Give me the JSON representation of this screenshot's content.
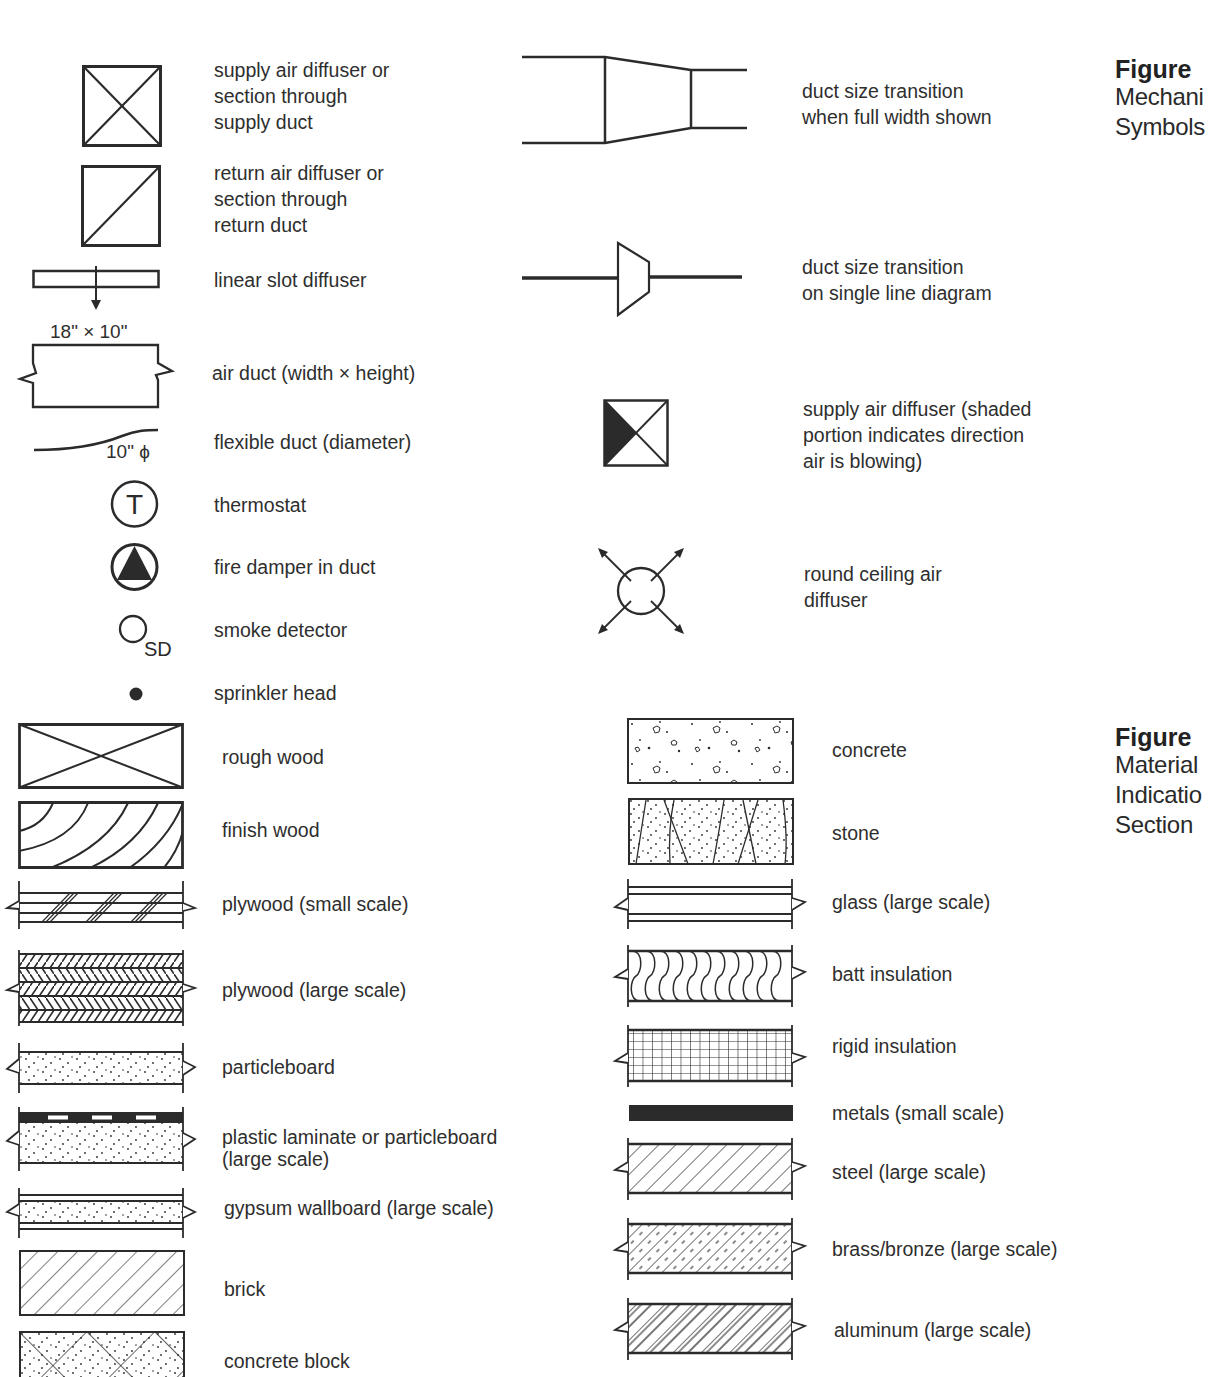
{
  "figures": [
    {
      "number": "Figure",
      "title": "Mechani\nSymbols",
      "symbols": [
        {
          "icon": "supply-air-diffuser-icon",
          "label": "supply air diffuser or\nsection through\nsupply duct"
        },
        {
          "icon": "return-air-diffuser-icon",
          "label": "return air diffuser or\nsection through\nreturn duct"
        },
        {
          "icon": "linear-slot-diffuser-icon",
          "label": "linear slot diffuser"
        },
        {
          "icon": "air-duct-icon",
          "label": "air duct (width × height)",
          "annotation": "18\" × 10\""
        },
        {
          "icon": "flexible-duct-icon",
          "label": "flexible duct (diameter)",
          "annotation": "10\" ϕ"
        },
        {
          "icon": "thermostat-icon",
          "label": "thermostat",
          "glyph": "T"
        },
        {
          "icon": "fire-damper-icon",
          "label": "fire damper in duct"
        },
        {
          "icon": "smoke-detector-icon",
          "label": "smoke detector",
          "glyph": "SD"
        },
        {
          "icon": "sprinkler-head-icon",
          "label": "sprinkler head"
        },
        {
          "icon": "duct-transition-full-width-icon",
          "label": "duct size transition\nwhen full width shown"
        },
        {
          "icon": "duct-transition-single-line-icon",
          "label": "duct size transition\non single line diagram"
        },
        {
          "icon": "directional-supply-diffuser-icon",
          "label": "supply air diffuser (shaded\nportion indicates direction\nair is blowing)"
        },
        {
          "icon": "round-ceiling-diffuser-icon",
          "label": "round ceiling air\ndiffuser"
        }
      ]
    },
    {
      "number": "Figure",
      "title": "Material\nIndicatio\nSection",
      "materials": [
        {
          "icon": "rough-wood-icon",
          "label": "rough wood"
        },
        {
          "icon": "finish-wood-icon",
          "label": "finish wood"
        },
        {
          "icon": "plywood-small-scale-icon",
          "label": "plywood (small scale)"
        },
        {
          "icon": "plywood-large-scale-icon",
          "label": "plywood (large scale)"
        },
        {
          "icon": "particleboard-icon",
          "label": "particleboard"
        },
        {
          "icon": "plastic-laminate-icon",
          "label": "plastic laminate or particleboard\n(large scale)"
        },
        {
          "icon": "gypsum-wallboard-icon",
          "label": "gypsum wallboard (large scale)"
        },
        {
          "icon": "brick-icon",
          "label": "brick"
        },
        {
          "icon": "concrete-block-icon",
          "label": "concrete block"
        },
        {
          "icon": "concrete-icon",
          "label": "concrete"
        },
        {
          "icon": "stone-icon",
          "label": "stone"
        },
        {
          "icon": "glass-icon",
          "label": "glass (large scale)"
        },
        {
          "icon": "batt-insulation-icon",
          "label": "batt insulation"
        },
        {
          "icon": "rigid-insulation-icon",
          "label": "rigid insulation"
        },
        {
          "icon": "metals-small-scale-icon",
          "label": "metals (small scale)"
        },
        {
          "icon": "steel-icon",
          "label": "steel (large scale)"
        },
        {
          "icon": "brass-bronze-icon",
          "label": "brass/bronze (large scale)"
        },
        {
          "icon": "aluminum-icon",
          "label": "aluminum (large scale)"
        }
      ]
    }
  ],
  "colors": {
    "ink": "#2b2b2b",
    "paper": "#ffffff"
  }
}
